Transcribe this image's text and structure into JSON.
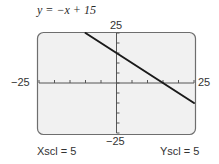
{
  "chart_data": {
    "type": "line",
    "title": "y = −x + 15",
    "equation": {
      "slope": -1,
      "intercept": 15
    },
    "series": [
      {
        "name": "y = −x + 15",
        "x": [
          -10,
          25
        ],
        "y": [
          25,
          -10
        ],
        "color": "#1a1a1a"
      }
    ],
    "xlim": [
      -25,
      25
    ],
    "ylim": [
      -25,
      25
    ],
    "xscl": 5,
    "yscl": 5,
    "tick_labels": {
      "x_min": "−25",
      "x_max": "25",
      "y_min": "−25",
      "y_max": "25"
    },
    "grid": false,
    "xlabel": "",
    "ylabel": ""
  },
  "labels": {
    "title": "y = −x + 15",
    "x_min": "−25",
    "x_max": "25",
    "y_min": "−25",
    "y_max": "25",
    "xscl": "Xscl = 5",
    "yscl": "Yscl = 5"
  },
  "colors": {
    "screen_bg": "#f1f1f1",
    "screen_border": "#6e6e6e",
    "axis": "#555555",
    "line": "#1a1a1a"
  }
}
